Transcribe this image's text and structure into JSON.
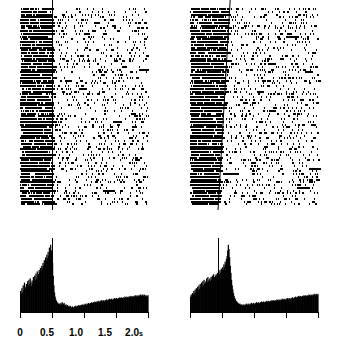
{
  "figure": {
    "type": "neural-raster-psth",
    "panel_count": 2,
    "background_color": "#ffffff",
    "ink_color": "#000000"
  },
  "panels": [
    {
      "id": "left",
      "name": "left-panel",
      "marker_line": {
        "kind": "vertical",
        "time_s": 0.5,
        "top_time_s": 0.5,
        "bottom_time_s": 0.5,
        "color": "#000000"
      },
      "raster": {
        "trials": 72,
        "time_range_s": [
          0.0,
          2.0
        ],
        "pre_event_density": "dense",
        "post_event_density": "sparse"
      },
      "axis": {
        "visible": true,
        "ticks": [
          {
            "value": 0.0,
            "label": "0"
          },
          {
            "value": 0.5,
            "label": "0.5"
          },
          {
            "value": 1.0,
            "label": "1.0"
          },
          {
            "value": 1.5,
            "label": "1.5"
          },
          {
            "value": 2.0,
            "label": "2.0",
            "unit": "s"
          }
        ]
      }
    },
    {
      "id": "right",
      "name": "right-panel",
      "marker_line": {
        "kind": "slanted",
        "top_time_s": 0.62,
        "bottom_time_s": 0.43,
        "color": "#000000"
      },
      "raster": {
        "trials": 72,
        "time_range_s": [
          0.0,
          2.0
        ],
        "pre_event_density": "dense",
        "post_event_density": "sparse"
      },
      "axis": {
        "visible": true,
        "ticks": [
          {
            "value": 0.0,
            "label": ""
          },
          {
            "value": 0.5,
            "label": ""
          },
          {
            "value": 1.0,
            "label": ""
          },
          {
            "value": 1.5,
            "label": ""
          },
          {
            "value": 2.0,
            "label": ""
          }
        ]
      }
    }
  ],
  "chart_data": [
    {
      "type": "bar",
      "id": "psth-left",
      "title": "",
      "subtitle": "",
      "xlabel": "",
      "ylabel": "",
      "xlim": [
        0.0,
        2.0
      ],
      "ylim": [
        0,
        100
      ],
      "grid": false,
      "legend": null,
      "bin_width_s": 0.01,
      "x": [
        0.0,
        0.01,
        0.02,
        0.03,
        0.04,
        0.05,
        0.06,
        0.07,
        0.08,
        0.09,
        0.1,
        0.11,
        0.12,
        0.13,
        0.14,
        0.15,
        0.16,
        0.17,
        0.18,
        0.19,
        0.2,
        0.21,
        0.22,
        0.23,
        0.24,
        0.25,
        0.26,
        0.27,
        0.28,
        0.29,
        0.3,
        0.31,
        0.32,
        0.33,
        0.34,
        0.35,
        0.36,
        0.37,
        0.38,
        0.39,
        0.4,
        0.41,
        0.42,
        0.43,
        0.44,
        0.45,
        0.46,
        0.47,
        0.48,
        0.49,
        0.5,
        0.51,
        0.52,
        0.53,
        0.54,
        0.55,
        0.56,
        0.57,
        0.58,
        0.59,
        0.6,
        0.61,
        0.62,
        0.63,
        0.64,
        0.65,
        0.66,
        0.67,
        0.68,
        0.69,
        0.7,
        0.71,
        0.72,
        0.73,
        0.74,
        0.75,
        0.76,
        0.77,
        0.78,
        0.79,
        0.8,
        0.81,
        0.82,
        0.83,
        0.84,
        0.85,
        0.86,
        0.87,
        0.88,
        0.89,
        0.9,
        0.91,
        0.92,
        0.93,
        0.94,
        0.95,
        0.96,
        0.97,
        0.98,
        0.99,
        1.0,
        1.01,
        1.02,
        1.03,
        1.04,
        1.05,
        1.06,
        1.07,
        1.08,
        1.09,
        1.1,
        1.11,
        1.12,
        1.13,
        1.14,
        1.15,
        1.16,
        1.17,
        1.18,
        1.19,
        1.2,
        1.21,
        1.22,
        1.23,
        1.24,
        1.25,
        1.26,
        1.27,
        1.28,
        1.29,
        1.3,
        1.31,
        1.32,
        1.33,
        1.34,
        1.35,
        1.36,
        1.37,
        1.38,
        1.39,
        1.4,
        1.41,
        1.42,
        1.43,
        1.44,
        1.45,
        1.46,
        1.47,
        1.48,
        1.49,
        1.5,
        1.51,
        1.52,
        1.53,
        1.54,
        1.55,
        1.56,
        1.57,
        1.58,
        1.59,
        1.6,
        1.61,
        1.62,
        1.63,
        1.64,
        1.65,
        1.66,
        1.67,
        1.68,
        1.69,
        1.7,
        1.71,
        1.72,
        1.73,
        1.74,
        1.75,
        1.76,
        1.77,
        1.78,
        1.79,
        1.8,
        1.81,
        1.82,
        1.83,
        1.84,
        1.85,
        1.86,
        1.87,
        1.88,
        1.89,
        1.9,
        1.91,
        1.92,
        1.93,
        1.94,
        1.95,
        1.96,
        1.97,
        1.98,
        1.99
      ],
      "values": [
        30,
        26,
        34,
        28,
        38,
        31,
        42,
        36,
        33,
        40,
        35,
        44,
        38,
        46,
        40,
        48,
        42,
        37,
        45,
        41,
        50,
        44,
        52,
        46,
        55,
        48,
        58,
        51,
        54,
        60,
        57,
        63,
        59,
        66,
        62,
        70,
        66,
        74,
        69,
        78,
        73,
        82,
        77,
        86,
        80,
        92,
        86,
        96,
        88,
        82,
        70,
        52,
        38,
        28,
        22,
        18,
        16,
        14,
        13,
        12,
        11,
        12,
        10,
        13,
        11,
        14,
        12,
        11,
        13,
        10,
        9,
        11,
        8,
        10,
        9,
        8,
        7,
        9,
        8,
        7,
        6,
        8,
        7,
        6,
        8,
        7,
        9,
        8,
        7,
        9,
        8,
        10,
        9,
        8,
        10,
        9,
        11,
        10,
        9,
        11,
        10,
        12,
        11,
        10,
        12,
        11,
        13,
        12,
        11,
        13,
        12,
        14,
        13,
        12,
        14,
        13,
        15,
        14,
        13,
        15,
        14,
        16,
        15,
        14,
        16,
        15,
        17,
        16,
        15,
        17,
        16,
        15,
        17,
        16,
        18,
        17,
        16,
        18,
        17,
        19,
        18,
        17,
        19,
        18,
        17,
        19,
        18,
        20,
        19,
        18,
        20,
        19,
        18,
        20,
        19,
        21,
        20,
        19,
        21,
        20,
        19,
        21,
        20,
        22,
        21,
        20,
        22,
        21,
        20,
        22,
        21,
        23,
        22,
        21,
        23,
        22,
        21,
        23,
        22,
        24,
        23,
        22,
        24,
        23,
        22,
        24,
        23,
        25,
        24,
        23,
        25,
        24,
        23,
        25,
        24,
        22,
        24,
        23,
        22,
        24
      ]
    },
    {
      "type": "bar",
      "id": "psth-right",
      "title": "",
      "subtitle": "",
      "xlabel": "",
      "ylabel": "",
      "xlim": [
        0.0,
        2.0
      ],
      "ylim": [
        0,
        100
      ],
      "grid": false,
      "legend": null,
      "bin_width_s": 0.01,
      "x": [
        0.0,
        0.01,
        0.02,
        0.03,
        0.04,
        0.05,
        0.06,
        0.07,
        0.08,
        0.09,
        0.1,
        0.11,
        0.12,
        0.13,
        0.14,
        0.15,
        0.16,
        0.17,
        0.18,
        0.19,
        0.2,
        0.21,
        0.22,
        0.23,
        0.24,
        0.25,
        0.26,
        0.27,
        0.28,
        0.29,
        0.3,
        0.31,
        0.32,
        0.33,
        0.34,
        0.35,
        0.36,
        0.37,
        0.38,
        0.39,
        0.4,
        0.41,
        0.42,
        0.43,
        0.44,
        0.45,
        0.46,
        0.47,
        0.48,
        0.49,
        0.5,
        0.51,
        0.52,
        0.53,
        0.54,
        0.55,
        0.56,
        0.57,
        0.58,
        0.59,
        0.6,
        0.61,
        0.62,
        0.63,
        0.64,
        0.65,
        0.66,
        0.67,
        0.68,
        0.69,
        0.7,
        0.71,
        0.72,
        0.73,
        0.74,
        0.75,
        0.76,
        0.77,
        0.78,
        0.79,
        0.8,
        0.81,
        0.82,
        0.83,
        0.84,
        0.85,
        0.86,
        0.87,
        0.88,
        0.89,
        0.9,
        0.91,
        0.92,
        0.93,
        0.94,
        0.95,
        0.96,
        0.97,
        0.98,
        0.99,
        1.0,
        1.01,
        1.02,
        1.03,
        1.04,
        1.05,
        1.06,
        1.07,
        1.08,
        1.09,
        1.1,
        1.11,
        1.12,
        1.13,
        1.14,
        1.15,
        1.16,
        1.17,
        1.18,
        1.19,
        1.2,
        1.21,
        1.22,
        1.23,
        1.24,
        1.25,
        1.26,
        1.27,
        1.28,
        1.29,
        1.3,
        1.31,
        1.32,
        1.33,
        1.34,
        1.35,
        1.36,
        1.37,
        1.38,
        1.39,
        1.4,
        1.41,
        1.42,
        1.43,
        1.44,
        1.45,
        1.46,
        1.47,
        1.48,
        1.49,
        1.5,
        1.51,
        1.52,
        1.53,
        1.54,
        1.55,
        1.56,
        1.57,
        1.58,
        1.59,
        1.6,
        1.61,
        1.62,
        1.63,
        1.64,
        1.65,
        1.66,
        1.67,
        1.68,
        1.69,
        1.7,
        1.71,
        1.72,
        1.73,
        1.74,
        1.75,
        1.76,
        1.77,
        1.78,
        1.79,
        1.8,
        1.81,
        1.82,
        1.83,
        1.84,
        1.85,
        1.86,
        1.87,
        1.88,
        1.89,
        1.9,
        1.91,
        1.92,
        1.93,
        1.94,
        1.95,
        1.96,
        1.97,
        1.98,
        1.99
      ],
      "values": [
        22,
        25,
        21,
        27,
        24,
        30,
        26,
        32,
        28,
        34,
        30,
        36,
        31,
        38,
        33,
        40,
        35,
        42,
        36,
        44,
        38,
        46,
        40,
        42,
        44,
        48,
        42,
        50,
        44,
        46,
        48,
        44,
        50,
        46,
        52,
        48,
        54,
        50,
        46,
        52,
        54,
        50,
        56,
        52,
        58,
        54,
        60,
        56,
        62,
        58,
        64,
        60,
        68,
        64,
        72,
        68,
        76,
        80,
        88,
        96,
        90,
        78,
        66,
        56,
        46,
        38,
        32,
        27,
        23,
        20,
        18,
        16,
        15,
        14,
        13,
        12,
        11,
        12,
        10,
        11,
        10,
        9,
        11,
        10,
        9,
        11,
        10,
        12,
        11,
        10,
        12,
        11,
        10,
        12,
        11,
        13,
        12,
        11,
        13,
        12,
        11,
        13,
        12,
        14,
        13,
        12,
        14,
        13,
        12,
        14,
        13,
        15,
        14,
        13,
        15,
        14,
        13,
        15,
        14,
        16,
        15,
        14,
        16,
        15,
        14,
        16,
        15,
        17,
        16,
        15,
        17,
        16,
        15,
        17,
        16,
        18,
        17,
        16,
        18,
        17,
        16,
        18,
        17,
        19,
        18,
        17,
        19,
        18,
        17,
        19,
        18,
        20,
        19,
        18,
        20,
        19,
        18,
        20,
        19,
        21,
        20,
        19,
        21,
        20,
        22,
        21,
        20,
        22,
        21,
        23,
        22,
        21,
        23,
        22,
        21,
        23,
        22,
        24,
        23,
        22,
        24,
        23,
        22,
        24,
        23,
        25,
        24,
        23,
        25,
        24,
        23,
        25,
        24,
        26,
        25,
        24,
        26,
        25,
        24,
        26
      ]
    }
  ]
}
